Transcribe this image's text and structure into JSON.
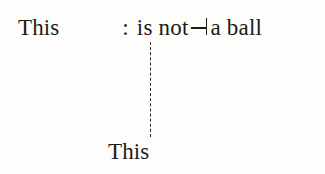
{
  "figure": {
    "background_color": "#fdfdfc",
    "ink_color": "#1d1a18",
    "sentence": {
      "subject": "This",
      "colon": ":",
      "predicate_before_symbol": "is not",
      "symbol_name": "reverse-turnstile",
      "symbol_char": "⊣",
      "predicate_after_symbol": "a ball",
      "full_text": "This : is not ⊣ a ball"
    },
    "connector": {
      "style": "dashed",
      "orientation": "vertical",
      "color": "#26221f"
    },
    "referent": {
      "label": "This"
    }
  }
}
